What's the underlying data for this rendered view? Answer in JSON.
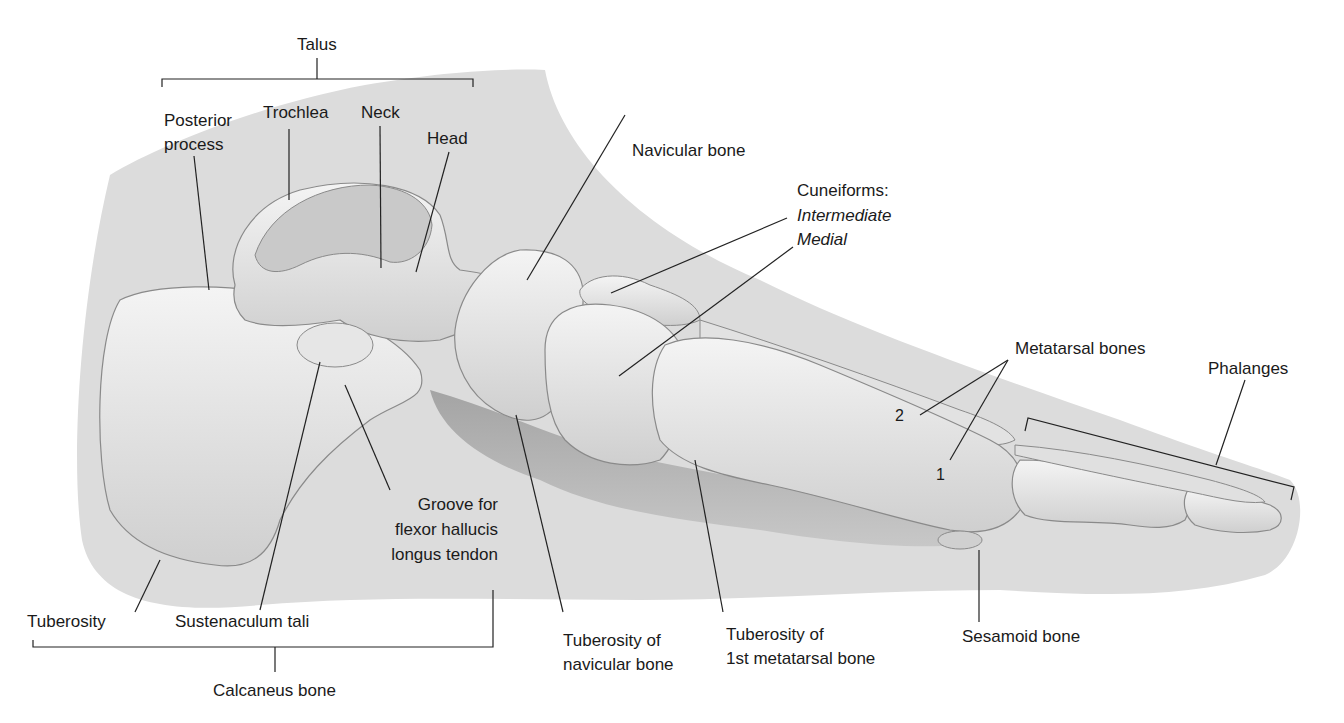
{
  "colors": {
    "background": "#ffffff",
    "silhouette": "#d9d9d9",
    "bone": "#ebebeb",
    "bone_shadow": "#a8a8a8",
    "leader_line": "#222222",
    "text": "#1a1a1a"
  },
  "labels": {
    "talus": "Talus",
    "posterior_process_1": "Posterior",
    "posterior_process_2": "process",
    "trochlea": "Trochlea",
    "neck": "Neck",
    "head": "Head",
    "navicular_bone": "Navicular bone",
    "cuneiforms": "Cuneiforms:",
    "intermediate": "Intermediate",
    "medial": "Medial",
    "metatarsal_bones": "Metatarsal bones",
    "phalanges": "Phalanges",
    "metatarsal_2": "2",
    "metatarsal_1": "1",
    "groove_1": "Groove for",
    "groove_2": "flexor hallucis",
    "groove_3": "longus tendon",
    "tuberosity": "Tuberosity",
    "sustentaculum_tali": "Sustenaculum tali",
    "calcaneus_bone": "Calcaneus bone",
    "tuberosity_navicular_1": "Tuberosity of",
    "tuberosity_navicular_2": "navicular bone",
    "tuberosity_metatarsal_1": "Tuberosity of",
    "tuberosity_metatarsal_2": "1st metatarsal bone",
    "sesamoid_bone": "Sesamoid bone"
  }
}
